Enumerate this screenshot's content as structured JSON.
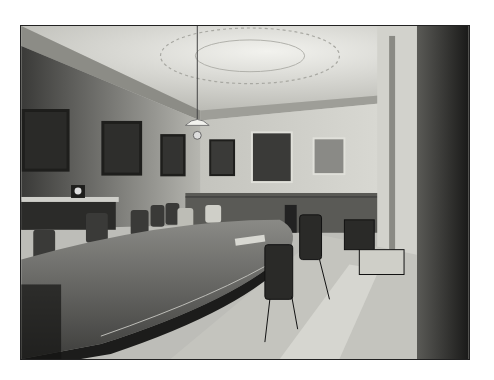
{
  "image": {
    "description": "Vintage black-and-white photograph of a formal boardroom with a long oval table, leather chairs, framed portraits, ornate plaster ceiling and a hanging lamp",
    "colors": {
      "background": "#ffffff",
      "frame": "#222222",
      "ceiling": "#e6e6e2",
      "wall": "#b9b9b3",
      "table": "#6e6e6b",
      "shadow": "#111111",
      "carpet": "#c8c8c2"
    },
    "elements": {
      "portraits_count": 7,
      "lamp": "hanging-lamp",
      "clock": "mantel-clock",
      "table": "oval-boardroom-table",
      "chairs": "leather-dining-chairs"
    }
  }
}
